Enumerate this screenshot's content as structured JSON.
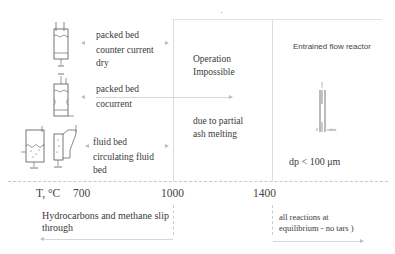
{
  "regions": {
    "operation_impossible": {
      "title_line1": "Operation",
      "title_line2": "Impossible",
      "reason_line1": "due to partial",
      "reason_line2": "ash melting"
    },
    "entrained_flow": {
      "title": "Entrained flow reactor",
      "particle_size": "dp < 100  μm",
      "icon_label": "oxidant"
    }
  },
  "reactors": [
    {
      "line1": "packed bed",
      "line2": "counter current",
      "line3": "dry"
    },
    {
      "line1": "packed bed",
      "line2": "cocurrent"
    },
    {
      "line1": "fluid bed",
      "line2": "circulating fluid",
      "line3": "bed"
    }
  ],
  "axis": {
    "label": "T, °C",
    "ticks": [
      "700",
      "1000",
      "1400"
    ]
  },
  "notes": {
    "low_temp_line1": "Hydrocarbons and methane slip",
    "low_temp_line2": "through",
    "high_temp_line1": "all reactions at",
    "high_temp_line2": "equilibrium - no tars )"
  },
  "colors": {
    "line": "#dcdcdc",
    "text": "#3a3a3a",
    "arrow": "#bbbbbb"
  }
}
